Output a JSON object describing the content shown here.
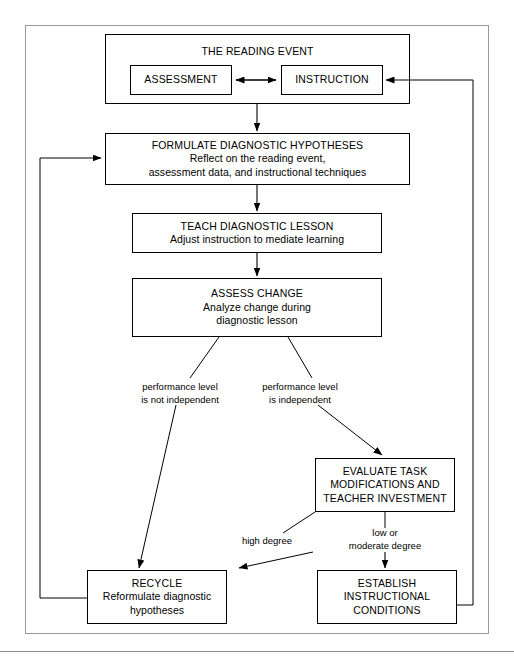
{
  "diagram": {
    "type": "flowchart",
    "nodes": [
      {
        "id": "reading-event",
        "label": "THE READING EVENT",
        "lines": [
          "THE READING EVENT"
        ]
      },
      {
        "id": "assessment",
        "label": "ASSESSMENT",
        "lines": [
          "ASSESSMENT"
        ]
      },
      {
        "id": "instruction",
        "label": "INSTRUCTION",
        "lines": [
          "INSTRUCTION"
        ]
      },
      {
        "id": "formulate",
        "label": "FORMULATE DIAGNOSTIC HYPOTHESES",
        "lines": [
          "FORMULATE DIAGNOSTIC HYPOTHESES",
          "Reflect on the reading event,",
          "assessment data, and instructional techniques"
        ]
      },
      {
        "id": "teach",
        "label": "TEACH DIAGNOSTIC LESSON",
        "lines": [
          "TEACH DIAGNOSTIC LESSON",
          "Adjust instruction to mediate learning"
        ]
      },
      {
        "id": "assess-change",
        "label": "ASSESS CHANGE",
        "lines": [
          "ASSESS CHANGE",
          "Analyze change during",
          "diagnostic lesson"
        ]
      },
      {
        "id": "evaluate",
        "label": "EVALUATE TASK MODIFICATIONS AND TEACHER INVESTMENT",
        "lines": [
          "EVALUATE TASK",
          "MODIFICATIONS AND",
          "TEACHER INVESTMENT"
        ]
      },
      {
        "id": "recycle",
        "label": "RECYCLE",
        "lines": [
          "RECYCLE",
          "Reformulate diagnostic",
          "hypotheses"
        ]
      },
      {
        "id": "establish",
        "label": "ESTABLISH INSTRUCTIONAL CONDITIONS",
        "lines": [
          "ESTABLISH",
          "INSTRUCTIONAL",
          "CONDITIONS"
        ]
      }
    ],
    "edge_labels": [
      {
        "id": "not-independent",
        "lines": [
          "performance level",
          "is not independent"
        ]
      },
      {
        "id": "independent",
        "lines": [
          "performance level",
          "is independent"
        ]
      },
      {
        "id": "high-degree",
        "lines": [
          "high degree"
        ]
      },
      {
        "id": "low-moderate-degree",
        "lines": [
          "low or",
          "moderate degree"
        ]
      }
    ],
    "colors": {
      "stroke": "#000000",
      "frame": "#9a9a9a",
      "background": "#ffffff",
      "text": "#000000"
    }
  },
  "node_text": {
    "reading_event": "THE READING EVENT",
    "assessment": "ASSESSMENT",
    "instruction": "INSTRUCTION",
    "formulate_l1": "FORMULATE DIAGNOSTIC HYPOTHESES",
    "formulate_l2": "Reflect on the reading event,",
    "formulate_l3": "assessment data, and instructional techniques",
    "teach_l1": "TEACH DIAGNOSTIC LESSON",
    "teach_l2": "Adjust instruction to mediate learning",
    "assess_l1": "ASSESS CHANGE",
    "assess_l2": "Analyze change during",
    "assess_l3": "diagnostic lesson",
    "evaluate_l1": "EVALUATE TASK",
    "evaluate_l2": "MODIFICATIONS AND",
    "evaluate_l3": "TEACHER INVESTMENT",
    "recycle_l1": "RECYCLE",
    "recycle_l2": "Reformulate diagnostic",
    "recycle_l3": "hypotheses",
    "establish_l1": "ESTABLISH",
    "establish_l2": "INSTRUCTIONAL",
    "establish_l3": "CONDITIONS"
  },
  "label_text": {
    "not_independent_l1": "performance level",
    "not_independent_l2": "is not independent",
    "independent_l1": "performance level",
    "independent_l2": "is independent",
    "high_degree": "high degree",
    "low_moderate_l1": "low or",
    "low_moderate_l2": "moderate degree"
  }
}
